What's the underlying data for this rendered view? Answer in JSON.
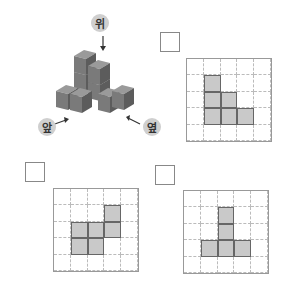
{
  "figure": {
    "labels": {
      "top": "위",
      "front": "앞",
      "side": "옆"
    }
  },
  "grids": [
    {
      "name": "top-right",
      "filled": [
        [
          1,
          1
        ],
        [
          2,
          1
        ],
        [
          2,
          2
        ],
        [
          3,
          1
        ],
        [
          3,
          2
        ],
        [
          3,
          3
        ]
      ]
    },
    {
      "name": "bottom-left",
      "filled": [
        [
          1,
          3
        ],
        [
          2,
          1
        ],
        [
          2,
          2
        ],
        [
          2,
          3
        ],
        [
          3,
          1
        ],
        [
          3,
          2
        ]
      ]
    },
    {
      "name": "bottom-right",
      "filled": [
        [
          1,
          2
        ],
        [
          2,
          2
        ],
        [
          3,
          1
        ],
        [
          3,
          2
        ],
        [
          3,
          3
        ]
      ]
    }
  ]
}
